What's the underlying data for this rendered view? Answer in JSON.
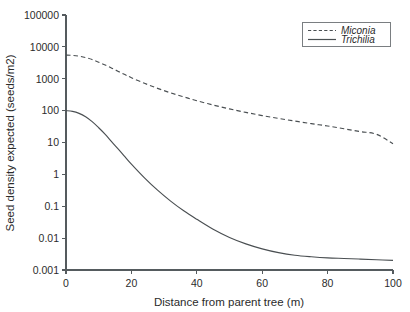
{
  "chart_data": {
    "type": "line",
    "title": "",
    "xlabel": "Distance from parent tree (m)",
    "ylabel": "Seed density expected (seeds/m2)",
    "xlim": [
      0,
      100
    ],
    "ylim": [
      0.001,
      100000
    ],
    "yscale": "log",
    "xscale": "linear",
    "grid": false,
    "legend_position": "top-right",
    "xticks": [
      0,
      20,
      40,
      60,
      80,
      100
    ],
    "xtick_labels": [
      "0",
      "20",
      "40",
      "60",
      "80",
      "100"
    ],
    "yticks": [
      0.001,
      0.01,
      0.1,
      1,
      10,
      100,
      1000,
      10000,
      100000
    ],
    "ytick_labels": [
      "0.001",
      "0.01",
      "0.1",
      "1",
      "10",
      "100",
      "1000",
      "10000",
      "100000"
    ],
    "x": [
      0,
      2,
      4,
      6,
      8,
      10,
      12,
      14,
      16,
      18,
      20,
      24,
      28,
      32,
      36,
      40,
      45,
      50,
      55,
      60,
      65,
      70,
      75,
      80,
      85,
      90,
      95,
      100
    ],
    "series": [
      {
        "name": "Miconia",
        "style": "dashed",
        "color": "#4a4f52",
        "values": [
          5500,
          5400,
          5100,
          4600,
          4000,
          3300,
          2700,
          2150,
          1700,
          1350,
          1080,
          720,
          500,
          360,
          270,
          205,
          150,
          113,
          88,
          70,
          57,
          47,
          39,
          33,
          27,
          22,
          18,
          9.2
        ]
      },
      {
        "name": "Trichilia",
        "style": "solid",
        "color": "#4a4f52",
        "values": [
          100,
          95,
          82,
          64,
          45,
          29,
          18,
          10.5,
          6.2,
          3.6,
          2.1,
          0.78,
          0.32,
          0.145,
          0.072,
          0.039,
          0.019,
          0.0105,
          0.0066,
          0.0046,
          0.0035,
          0.0029,
          0.0026,
          0.0024,
          0.0023,
          0.0022,
          0.0021,
          0.002
        ]
      }
    ],
    "legend_entries": [
      {
        "label": "Miconia",
        "style": "dashed"
      },
      {
        "label": "Trichilia",
        "style": "solid"
      }
    ]
  },
  "colors": {
    "background": "#ffffff",
    "axis": "#555b5e",
    "line": "#4a4f52",
    "text": "#2b2b2b"
  }
}
